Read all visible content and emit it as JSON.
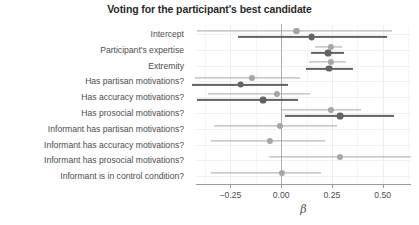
{
  "chart_data": {
    "type": "scatter",
    "subtype": "coefficient-forest-plot",
    "title": "Voting for the participant's best candidate",
    "xlabel": "β",
    "ylabel": "",
    "xlim": [
      -0.42,
      0.64
    ],
    "xticks": [
      -0.25,
      0.0,
      0.25,
      0.5
    ],
    "xticklabels": [
      "−0.25",
      "0.00",
      "0.25",
      "0.50"
    ],
    "grid": true,
    "legend": false,
    "zero_reference_line": 0.0,
    "categories": [
      "Intercept",
      "Participant's expertise",
      "Extremity",
      "Has partisan motivations?",
      "Has accuracy motivations?",
      "Has prosocial motivations?",
      "Informant has partisan motivations?",
      "Informant has accuracy motivations?",
      "Informant has prosocial motivations?",
      "Informant is in control condition?"
    ],
    "series": [
      {
        "name": "light",
        "color": "#a6a6a6",
        "estimates": [
          0.075,
          0.245,
          0.245,
          -0.145,
          -0.02,
          0.245,
          -0.005,
          -0.055,
          0.29,
          0.005
        ],
        "ci_low": [
          -0.415,
          0.165,
          0.135,
          -0.425,
          -0.36,
          0.0,
          -0.33,
          -0.345,
          -0.06,
          -0.345
        ],
        "ci_high": [
          0.545,
          0.3,
          0.32,
          0.095,
          0.14,
          0.395,
          0.275,
          0.215,
          0.64,
          0.195
        ]
      },
      {
        "name": "dark",
        "color": "#636363",
        "estimates": [
          0.15,
          0.23,
          0.235,
          -0.2,
          -0.09,
          0.29,
          null,
          null,
          null,
          null
        ],
        "ci_low": [
          -0.215,
          0.145,
          0.12,
          -0.44,
          -0.415,
          0.02,
          null,
          null,
          null,
          null
        ],
        "ci_high": [
          0.52,
          0.31,
          0.355,
          0.035,
          0.085,
          0.555,
          null,
          null,
          null,
          null
        ]
      }
    ]
  },
  "axes": {
    "x_tick_labels": [
      "−0.25",
      "0.00",
      "0.25",
      "0.50"
    ],
    "x_title": "β"
  },
  "title": {
    "text": "Voting for the participant's best candidate"
  },
  "rows": [
    {
      "label": "Intercept"
    },
    {
      "label": "Participant's expertise"
    },
    {
      "label": "Extremity"
    },
    {
      "label": "Has partisan motivations?"
    },
    {
      "label": "Has accuracy motivations?"
    },
    {
      "label": "Has prosocial motivations?"
    },
    {
      "label": "Informant has partisan motivations?"
    },
    {
      "label": "Informant has accuracy motivations?"
    },
    {
      "label": "Informant has prosocial motivations?"
    },
    {
      "label": "Informant is in control condition?"
    }
  ],
  "colors": {
    "light_series": "#a6a6a6",
    "dark_series": "#636363",
    "grid": "#efefef",
    "axis": "#9a9a9a",
    "text": "#4d4d4d",
    "title": "#2b2b2b"
  }
}
